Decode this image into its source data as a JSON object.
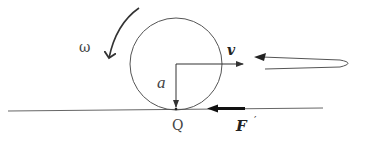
{
  "diagram": {
    "labels": {
      "omega": "ω",
      "radius": "a",
      "velocity": "v",
      "contact_point": "Q",
      "force": "F",
      "force_prime": "′"
    },
    "colors": {
      "stroke": "#555555",
      "dark_stroke": "#222222",
      "text": "#444444"
    }
  }
}
